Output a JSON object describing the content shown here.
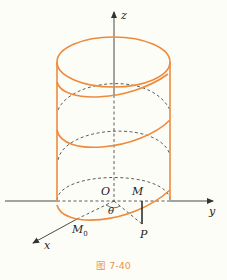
{
  "figure": {
    "caption": "图 7-40",
    "labels": {
      "z": "z",
      "y": "y",
      "x": "x",
      "O": "O",
      "M": "M",
      "P": "P",
      "M0": "M",
      "M0_sub": "0",
      "theta": "θ"
    },
    "colors": {
      "helix": "#ee8a3c",
      "axis": "#333333",
      "caption": "#e8954e",
      "background": "#fdfdf8"
    }
  }
}
